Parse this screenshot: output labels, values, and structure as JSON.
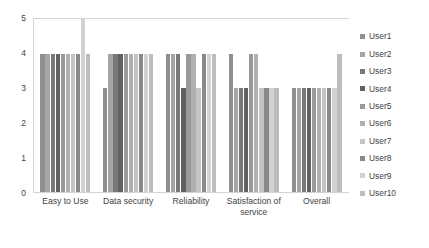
{
  "chart_data": {
    "type": "bar",
    "title": "",
    "xlabel": "",
    "ylabel": "",
    "ylim": [
      0,
      5
    ],
    "yticks": [
      "5",
      "4",
      "3",
      "2",
      "1",
      "0"
    ],
    "grid": false,
    "legend_position": "right",
    "categories": [
      "Easy to Use",
      "Data security",
      "Reliability",
      "Satisfaction of service",
      "Overall"
    ],
    "series": [
      {
        "name": "User1",
        "color": "#8f8f8f",
        "values": [
          4,
          3,
          4,
          4,
          3
        ]
      },
      {
        "name": "User2",
        "color": "#a5a5a5",
        "values": [
          4,
          4,
          4,
          3,
          3
        ]
      },
      {
        "name": "User3",
        "color": "#787878",
        "values": [
          4,
          4,
          4,
          3,
          3
        ]
      },
      {
        "name": "User4",
        "color": "#616161",
        "values": [
          4,
          4,
          3,
          3,
          3
        ]
      },
      {
        "name": "User5",
        "color": "#9a9a9a",
        "values": [
          4,
          4,
          4,
          4,
          3
        ]
      },
      {
        "name": "User6",
        "color": "#b0b0b0",
        "values": [
          4,
          4,
          4,
          4,
          3
        ]
      },
      {
        "name": "User7",
        "color": "#c4c4c4",
        "values": [
          4,
          4,
          3,
          3,
          3
        ]
      },
      {
        "name": "User8",
        "color": "#898989",
        "values": [
          4,
          4,
          4,
          3,
          3
        ]
      },
      {
        "name": "User9",
        "color": "#d2d2d2",
        "values": [
          5,
          4,
          4,
          3,
          3
        ]
      },
      {
        "name": "User10",
        "color": "#bdbdbd",
        "values": [
          4,
          4,
          4,
          3,
          4
        ]
      }
    ]
  }
}
